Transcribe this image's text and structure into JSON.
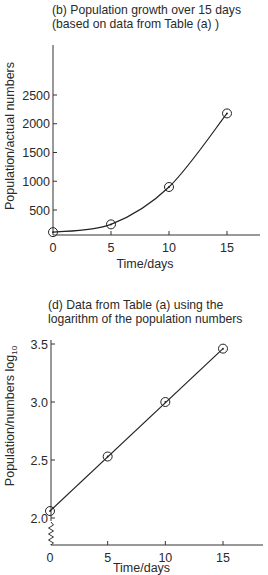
{
  "chart_data": [
    {
      "id": "b",
      "type": "line",
      "title_lines": [
        "(b) Population growth over 15 days",
        "(based on data from Table (a) )"
      ],
      "xlabel": "Time/days",
      "ylabel": "Population/actual numbers",
      "x_ticks": [
        0,
        5,
        10,
        15
      ],
      "y_ticks": [
        500,
        1000,
        1500,
        2000,
        2500
      ],
      "xlim": [
        0,
        18
      ],
      "ylim": [
        0,
        3000
      ],
      "grid": false,
      "curve": "smooth exponential fit",
      "series": [
        {
          "name": "Population",
          "x": [
            0,
            5,
            10,
            15
          ],
          "y": [
            115,
            250,
            900,
            2180
          ]
        }
      ]
    },
    {
      "id": "d",
      "type": "line",
      "title_lines": [
        "(d) Data from Table (a) using the",
        "logarithm of the population numbers"
      ],
      "xlabel": "Time/days",
      "ylabel": "Population/numbers log",
      "ylabel_subscript": "10",
      "x_ticks": [
        0,
        5,
        10,
        15
      ],
      "y_ticks": [
        2.0,
        2.5,
        3.0,
        3.5
      ],
      "y_tick_labels": [
        "2.0",
        "2.5",
        "3.0",
        "3.5"
      ],
      "xlim": [
        0,
        18
      ],
      "ylim": [
        1.75,
        3.55
      ],
      "axis_break": "zigzag on y-axis below 2.0",
      "grid": false,
      "curve": "straight line fit",
      "series": [
        {
          "name": "log10 Population",
          "x": [
            0,
            5,
            10,
            15
          ],
          "y": [
            2.06,
            2.53,
            3.0,
            3.46
          ]
        }
      ]
    }
  ]
}
